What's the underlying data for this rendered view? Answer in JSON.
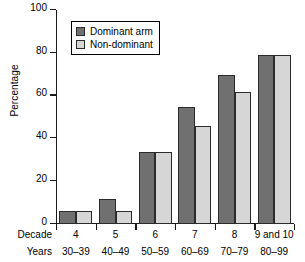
{
  "chart_data": {
    "type": "bar",
    "title": "",
    "xlabel": "",
    "ylabel": "Percentage",
    "ylim": [
      0,
      100
    ],
    "yticks": [
      0,
      20,
      40,
      60,
      80,
      100
    ],
    "ytick_labels": [
      "0",
      "20",
      "40",
      "60",
      "80",
      "100"
    ],
    "grid": false,
    "legend_position": "top-left",
    "categories": [
      "4",
      "5",
      "6",
      "7",
      "8",
      "9 and 10"
    ],
    "secondary_categories": [
      "30–39",
      "40–49",
      "50–59",
      "60–69",
      "70–79",
      "80–99"
    ],
    "series": [
      {
        "name": "Dominant arm",
        "color": "#707070",
        "values": [
          6,
          11.5,
          33.5,
          54.5,
          69.5,
          79
        ]
      },
      {
        "name": "Non-dominant",
        "color": "#d6d6d6",
        "values": [
          6,
          6,
          33.5,
          46,
          61.5,
          79
        ]
      }
    ]
  },
  "axes": {
    "y_label": "Percentage"
  },
  "legend": {
    "items": [
      {
        "label": "Dominant arm",
        "swatch": "dominant-arm-swatch"
      },
      {
        "label": "Non-dominant",
        "swatch": "non-dominant-swatch"
      }
    ]
  },
  "bottom_rows": {
    "decade_title": "Decade",
    "years_title": "Years",
    "decade_values": [
      "4",
      "5",
      "6",
      "7",
      "8",
      "9 and 10"
    ],
    "years_values": [
      "30–39",
      "40–49",
      "50–59",
      "60–69",
      "70–79",
      "80–99"
    ]
  }
}
